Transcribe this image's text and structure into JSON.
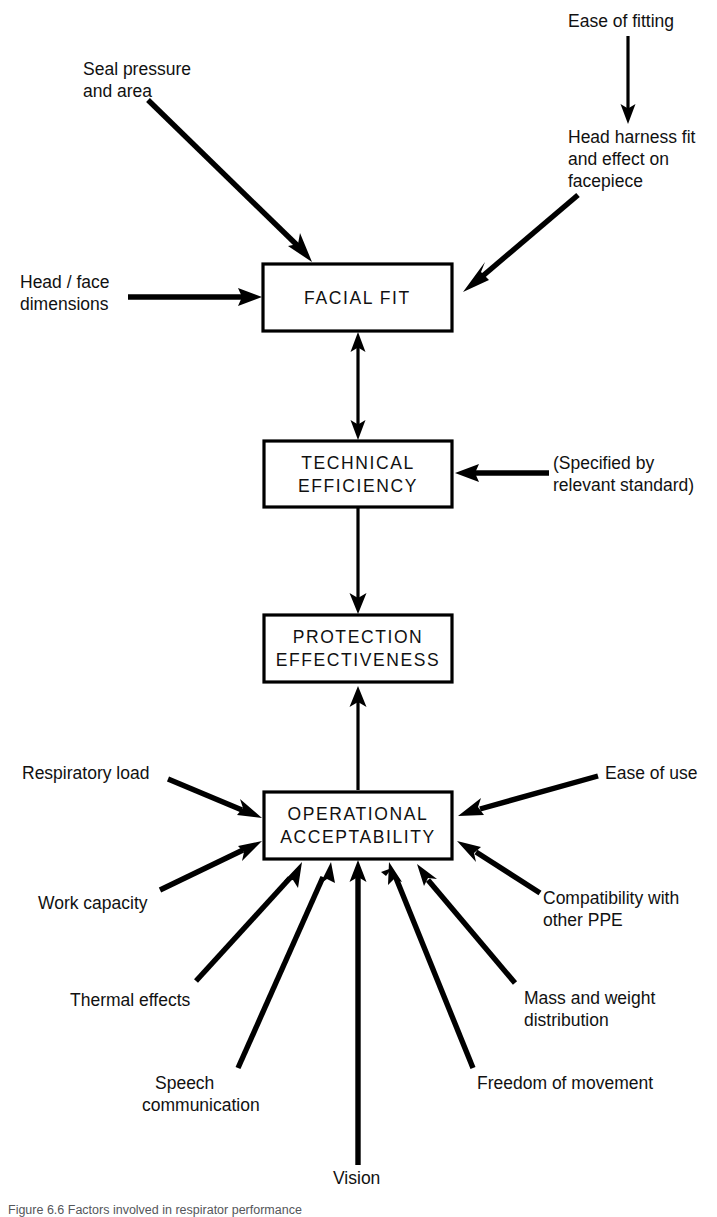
{
  "figure": {
    "width": 717,
    "height": 1213,
    "background_color": "#ffffff",
    "ink_color": "#000000",
    "caption": "Figure 6.6 Factors involved in respirator performance"
  },
  "boxes": [
    {
      "id": "facial-fit",
      "lines": [
        "FACIAL FIT"
      ],
      "x": 263,
      "y": 264,
      "w": 189,
      "h": 67
    },
    {
      "id": "technical-efficiency",
      "lines": [
        "TECHNICAL",
        "EFFICIENCY"
      ],
      "x": 264,
      "y": 441,
      "w": 188,
      "h": 66
    },
    {
      "id": "protection-effectiveness",
      "lines": [
        "PROTECTION",
        "EFFECTIVENESS"
      ],
      "x": 264,
      "y": 615,
      "w": 188,
      "h": 67
    },
    {
      "id": "operational-acceptability",
      "lines": [
        "OPERATIONAL",
        "ACCEPTABILITY"
      ],
      "x": 264,
      "y": 792,
      "w": 188,
      "h": 67
    }
  ],
  "labels": [
    {
      "id": "ease-of-fitting",
      "lines": [
        "Ease of fitting"
      ],
      "x": 568,
      "y": 22,
      "align": "start"
    },
    {
      "id": "seal-pressure-and-area",
      "lines": [
        "Seal pressure",
        "and area"
      ],
      "x": 83,
      "y": 70,
      "align": "start"
    },
    {
      "id": "head-harness-fit",
      "lines": [
        "Head harness fit",
        "and effect on",
        "facepiece"
      ],
      "x": 568,
      "y": 138,
      "align": "start"
    },
    {
      "id": "head-face-dimensions",
      "lines": [
        "Head / face",
        "dimensions"
      ],
      "x": 20,
      "y": 283,
      "align": "start"
    },
    {
      "id": "specified-by-relevant-standard",
      "lines": [
        "(Specified by",
        "relevant standard)"
      ],
      "x": 553,
      "y": 464,
      "align": "start"
    },
    {
      "id": "respiratory-load",
      "lines": [
        "Respiratory load"
      ],
      "x": 22,
      "y": 774,
      "align": "start"
    },
    {
      "id": "ease-of-use",
      "lines": [
        "Ease of use"
      ],
      "x": 605,
      "y": 774,
      "align": "start"
    },
    {
      "id": "work-capacity",
      "lines": [
        "Work capacity"
      ],
      "x": 38,
      "y": 904,
      "align": "start"
    },
    {
      "id": "compatibility-with-other-ppe",
      "lines": [
        "Compatibility with",
        "other PPE"
      ],
      "x": 543,
      "y": 899,
      "align": "start"
    },
    {
      "id": "thermal-effects",
      "lines": [
        "Thermal effects"
      ],
      "x": 70,
      "y": 1001,
      "align": "start"
    },
    {
      "id": "mass-and-weight-distribution",
      "lines": [
        "Mass and weight",
        "distribution"
      ],
      "x": 524,
      "y": 999,
      "align": "start"
    },
    {
      "id": "speech-communication",
      "lines": [
        "Speech",
        "communication"
      ],
      "x": 155,
      "y": 1084,
      "align": "start"
    },
    {
      "id": "freedom-of-movement",
      "lines": [
        "Freedom of movement"
      ],
      "x": 477,
      "y": 1084,
      "align": "start"
    },
    {
      "id": "vision",
      "lines": [
        "Vision"
      ],
      "x": 333,
      "y": 1179,
      "align": "start"
    }
  ],
  "connectors": [
    {
      "id": "ease-of-fitting-to-head-harness",
      "from": "ease-of-fitting",
      "to": "head-harness-fit",
      "weight": "thin"
    },
    {
      "id": "seal-pressure-to-facial-fit",
      "from": "seal-pressure-and-area",
      "to": "facial-fit",
      "weight": "thick"
    },
    {
      "id": "head-harness-to-facial-fit",
      "from": "head-harness-fit",
      "to": "facial-fit",
      "weight": "thick"
    },
    {
      "id": "head-face-dimensions-to-facial-fit",
      "from": "head-face-dimensions",
      "to": "facial-fit",
      "weight": "thick"
    },
    {
      "id": "facial-fit-technical-efficiency-bidirectional",
      "from": "facial-fit",
      "to": "technical-efficiency",
      "weight": "thin",
      "bidirectional": true
    },
    {
      "id": "standard-to-technical-efficiency",
      "from": "specified-by-relevant-standard",
      "to": "technical-efficiency",
      "weight": "thick"
    },
    {
      "id": "technical-efficiency-to-protection-effectiveness",
      "from": "technical-efficiency",
      "to": "protection-effectiveness",
      "weight": "thin"
    },
    {
      "id": "operational-acceptability-to-protection-effectiveness",
      "from": "operational-acceptability",
      "to": "protection-effectiveness",
      "weight": "thin"
    },
    {
      "id": "respiratory-load-to-operational",
      "from": "respiratory-load",
      "to": "operational-acceptability",
      "weight": "thick"
    },
    {
      "id": "ease-of-use-to-operational",
      "from": "ease-of-use",
      "to": "operational-acceptability",
      "weight": "thick"
    },
    {
      "id": "work-capacity-to-operational",
      "from": "work-capacity",
      "to": "operational-acceptability",
      "weight": "thick"
    },
    {
      "id": "compatibility-to-operational",
      "from": "compatibility-with-other-ppe",
      "to": "operational-acceptability",
      "weight": "thick"
    },
    {
      "id": "thermal-effects-to-operational",
      "from": "thermal-effects",
      "to": "operational-acceptability",
      "weight": "thick"
    },
    {
      "id": "mass-weight-to-operational",
      "from": "mass-and-weight-distribution",
      "to": "operational-acceptability",
      "weight": "thick"
    },
    {
      "id": "speech-communication-to-operational",
      "from": "speech-communication",
      "to": "operational-acceptability",
      "weight": "thick"
    },
    {
      "id": "freedom-of-movement-to-operational",
      "from": "freedom-of-movement",
      "to": "operational-acceptability",
      "weight": "thick"
    },
    {
      "id": "vision-to-operational",
      "from": "vision",
      "to": "operational-acceptability",
      "weight": "thick"
    }
  ]
}
